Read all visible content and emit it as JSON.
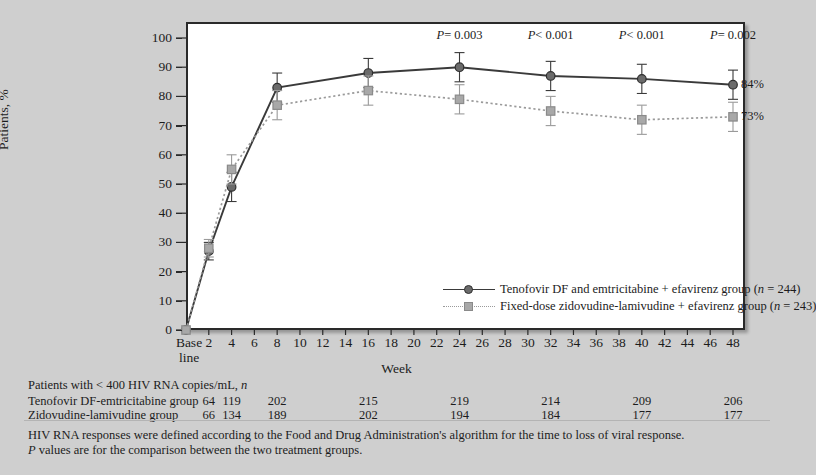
{
  "axes": {
    "ylabel": "Patients, %",
    "xlabel": "Week",
    "baseline_label_line1": "Base",
    "baseline_label_line2": "line",
    "yticks": [
      "0",
      "10",
      "20",
      "30",
      "40",
      "50",
      "60",
      "70",
      "80",
      "90",
      "100"
    ],
    "xticks": [
      "2",
      "4",
      "6",
      "8",
      "10",
      "12",
      "14",
      "16",
      "18",
      "20",
      "22",
      "24",
      "26",
      "28",
      "30",
      "32",
      "34",
      "36",
      "38",
      "40",
      "42",
      "44",
      "46",
      "48"
    ]
  },
  "annotations": {
    "p_values": [
      {
        "week": 24,
        "text": "P = 0.003"
      },
      {
        "week": 32,
        "text": "P < 0.001"
      },
      {
        "week": 40,
        "text": "P < 0.001"
      },
      {
        "week": 48,
        "text": "P = 0.002"
      }
    ],
    "endpoint_labels": [
      {
        "series": "tenofovir",
        "text": "84%"
      },
      {
        "series": "zidovudine",
        "text": "73%"
      }
    ]
  },
  "legend": {
    "position": "inside-bottom-right",
    "items": [
      {
        "marker": "circle",
        "line": "solid",
        "color": "#6b6b6b",
        "text": "Tenofovir DF and emtricitabine + efavirenz group (n = 244)"
      },
      {
        "marker": "square",
        "line": "dotted",
        "color": "#a8a8a8",
        "text": "Fixed-dose zidovudine-lamivudine + efavirenz group (n = 243)"
      }
    ]
  },
  "counts_table": {
    "title": "Patients with < 400 HIV RNA copies/mL, n",
    "columns": [
      "2",
      "4",
      "8",
      "16",
      "24",
      "32",
      "40",
      "48"
    ],
    "rows": [
      {
        "label": "Tenofovir DF-emtricitabine group",
        "values": [
          "64",
          "119",
          "202",
          "215",
          "219",
          "214",
          "209",
          "206"
        ]
      },
      {
        "label": "Zidovudine-lamivudine group",
        "values": [
          "66",
          "134",
          "189",
          "202",
          "194",
          "184",
          "177",
          "177"
        ]
      }
    ]
  },
  "footnotes": [
    "HIV RNA responses were defined according to the Food and Drug Administration's algorithm for the time to loss of viral response.",
    "P values are for the comparison between the two treatment groups."
  ],
  "colors": {
    "background": "#cfcfcf",
    "plot_background": "#ffffff",
    "frame": "#2a2a2a",
    "series_tenofovir": "#6b6b6b",
    "series_tenofovir_line": "#3a3a3a",
    "series_zidovudine": "#a8a8a8",
    "series_zidovudine_line": "#9a9a9a"
  },
  "chart_data": {
    "type": "line",
    "title": "",
    "xlabel": "Week",
    "ylabel": "Patients, %",
    "xlim": [
      0,
      49
    ],
    "ylim": [
      0,
      100
    ],
    "grid": false,
    "legend_position": "inside-bottom-right",
    "x": [
      0,
      2,
      4,
      8,
      16,
      24,
      32,
      40,
      48
    ],
    "x_tick_labels": [
      "Base line",
      "2",
      "4",
      "8",
      "16",
      "24",
      "32",
      "40",
      "48"
    ],
    "series": [
      {
        "name": "Tenofovir DF and emtricitabine + efavirenz group (n = 244)",
        "marker": "circle",
        "linestyle": "solid",
        "color": "#6b6b6b",
        "values": [
          0,
          27,
          49,
          83,
          88,
          90,
          87,
          86,
          84
        ],
        "error_lower": [
          0,
          3,
          5,
          5,
          5,
          5,
          5,
          5,
          5
        ],
        "error_upper": [
          0,
          3,
          5,
          5,
          5,
          5,
          5,
          5,
          5
        ],
        "end_label": "84%",
        "counts": [
          null,
          64,
          119,
          202,
          215,
          219,
          214,
          209,
          206
        ]
      },
      {
        "name": "Fixed-dose zidovudine-lamivudine + efavirenz group (n = 243)",
        "marker": "square",
        "linestyle": "dotted",
        "color": "#a8a8a8",
        "values": [
          0,
          28,
          55,
          77,
          82,
          79,
          75,
          72,
          73
        ],
        "error_lower": [
          0,
          3,
          5,
          5,
          5,
          5,
          5,
          5,
          5
        ],
        "error_upper": [
          0,
          3,
          5,
          5,
          5,
          5,
          5,
          5,
          5
        ],
        "end_label": "73%",
        "counts": [
          null,
          66,
          134,
          189,
          202,
          194,
          184,
          177,
          177
        ]
      }
    ],
    "annotations": [
      {
        "x": 24,
        "text": "P = 0.003"
      },
      {
        "x": 32,
        "text": "P < 0.001"
      },
      {
        "x": 40,
        "text": "P < 0.001"
      },
      {
        "x": 48,
        "text": "P = 0.002"
      }
    ]
  }
}
